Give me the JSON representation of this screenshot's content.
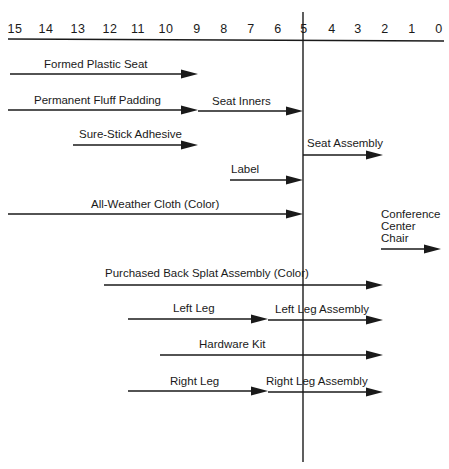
{
  "diagram": {
    "type": "assembly-timeline",
    "axis": {
      "ticks": [
        "15",
        "14",
        "13",
        "12",
        "11",
        "10",
        "9",
        "8",
        "7",
        "6",
        "5",
        "4",
        "3",
        "2",
        "1",
        "0"
      ],
      "tick_x": [
        15,
        46,
        78,
        110,
        138,
        166,
        197,
        224,
        251,
        278,
        304,
        332,
        358,
        385,
        412,
        439
      ],
      "y_text": 33,
      "y_line": 39,
      "x_start": 8,
      "x_end": 444,
      "marker_value": "5"
    },
    "reference_line": {
      "x": 303,
      "y_top": 12,
      "y_bottom": 462
    },
    "arrows": [
      {
        "id": "formed-plastic-seat",
        "label": "Formed Plastic Seat",
        "x1": 10,
        "x2": 198,
        "y": 74,
        "label_x": 44,
        "label_y": 68
      },
      {
        "id": "permanent-fluff-padding",
        "label": "Permanent Fluff Padding",
        "x1": 8,
        "x2": 198,
        "y": 110,
        "label_x": 34,
        "label_y": 104
      },
      {
        "id": "seat-inners",
        "label": "Seat Inners",
        "x1": 198,
        "x2": 303,
        "y": 111,
        "label_x": 212,
        "label_y": 105
      },
      {
        "id": "sure-stick-adhesive",
        "label": "Sure-Stick Adhesive",
        "x1": 73,
        "x2": 198,
        "y": 145,
        "label_x": 79,
        "label_y": 138
      },
      {
        "id": "seat-assembly",
        "label": "Seat Assembly",
        "x1": 303,
        "x2": 383,
        "y": 155,
        "label_x": 307,
        "label_y": 147
      },
      {
        "id": "label",
        "label": "Label",
        "x1": 230,
        "x2": 303,
        "y": 180,
        "label_x": 231,
        "label_y": 173
      },
      {
        "id": "all-weather-cloth",
        "label": "All-Weather Cloth (Color)",
        "x1": 8,
        "x2": 303,
        "y": 214,
        "label_x": 91,
        "label_y": 208
      },
      {
        "id": "conference-center-chair",
        "label": "Conference Center Chair",
        "label_lines": [
          "Conference",
          "Center",
          "Chair"
        ],
        "x1": 381,
        "x2": 441,
        "y": 249,
        "label_x": 381,
        "label_y": 218
      },
      {
        "id": "purchased-back-splat-assembly",
        "label": "Purchased Back Splat Assembly (Color)",
        "x1": 104,
        "x2": 383,
        "y": 285,
        "label_x": 105,
        "label_y": 277
      },
      {
        "id": "left-leg",
        "label": "Left Leg",
        "x1": 128,
        "x2": 268,
        "y": 319,
        "label_x": 173,
        "label_y": 312
      },
      {
        "id": "left-leg-assembly",
        "label": "Left Leg Assembly",
        "x1": 268,
        "x2": 383,
        "y": 320,
        "label_x": 275,
        "label_y": 313
      },
      {
        "id": "hardware-kit",
        "label": "Hardware Kit",
        "x1": 160,
        "x2": 383,
        "y": 355,
        "label_x": 199,
        "label_y": 348
      },
      {
        "id": "right-leg",
        "label": "Right Leg",
        "x1": 128,
        "x2": 268,
        "y": 391,
        "label_x": 170,
        "label_y": 385
      },
      {
        "id": "right-leg-assembly",
        "label": "Right Leg Assembly",
        "x1": 268,
        "x2": 383,
        "y": 392,
        "label_x": 266,
        "label_y": 385
      }
    ],
    "colors": {
      "ink": "#1a1a1a",
      "background": "#ffffff"
    }
  }
}
